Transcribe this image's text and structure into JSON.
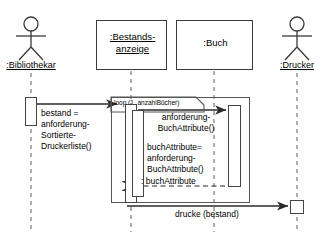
{
  "diagram": {
    "kind": "uml-sequence-diagram",
    "width": 331,
    "height": 237,
    "background": "#ffffff",
    "line_color": "#3a3a3a",
    "text_color": "#000000"
  },
  "participants": [
    {
      "id": "bibliothekar",
      "type": "actor",
      "label": ":Bibliothekar",
      "icon": "stick-figure-actor-icon"
    },
    {
      "id": "bestandsanzeige",
      "type": "object",
      "label_line1": ":Bestands-",
      "label_line2": "anzeige",
      "label": ":Bestands-anzeige"
    },
    {
      "id": "buch",
      "type": "object",
      "label": ":Buch"
    },
    {
      "id": "drucker",
      "type": "actor",
      "label": ":Drucker",
      "icon": "stick-figure-actor-icon"
    }
  ],
  "fragment": {
    "type": "loop",
    "label": "loop (1, anzahlBücher)"
  },
  "messages": [
    {
      "id": "m1",
      "from": "bibliothekar",
      "to": "bestandsanzeige",
      "style": "synchronous",
      "arrow": "solid",
      "lines": [
        "bestand =",
        "anforderung-",
        "Sortierte-",
        "Druckerliste()"
      ],
      "text": "bestand = anforderung-Sortierte-Druckerliste()"
    },
    {
      "id": "m2",
      "from": "bestandsanzeige",
      "to": "buch",
      "style": "synchronous",
      "arrow": "solid",
      "lines": [
        "anforderung-",
        "BuchAttribute()"
      ],
      "text": "anforderung-BuchAttribute()"
    },
    {
      "id": "m3",
      "from": "bestandsanzeige",
      "to": "buch",
      "style": "synchronous",
      "arrow": "solid",
      "lines": [
        "buchAttribute=",
        "anforderung-",
        "BuchAttribute()"
      ],
      "text": "buchAttribute= anforderung-BuchAttribute()"
    },
    {
      "id": "m4",
      "from": "buch",
      "to": "bestandsanzeige",
      "style": "return",
      "arrow": "dashed",
      "lines": [
        ": buchAttribute"
      ],
      "text": ": buchAttribute"
    },
    {
      "id": "m5",
      "from": "bestandsanzeige",
      "to": "drucker",
      "style": "synchronous",
      "arrow": "solid",
      "lines": [
        "drucke (bestand)"
      ],
      "text": "drucke (bestand)"
    }
  ]
}
